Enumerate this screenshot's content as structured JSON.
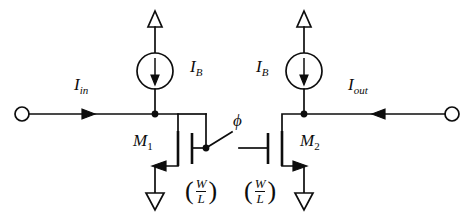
{
  "diagram": {
    "type": "circuit-schematic",
    "background_color": "#ffffff",
    "line_color": "#0d0d0d",
    "width": 476,
    "height": 219
  },
  "labels": {
    "i_in": {
      "symbol": "I",
      "subscript": "in"
    },
    "i_out": {
      "symbol": "I",
      "subscript": "out"
    },
    "i_bias_left": {
      "symbol": "I",
      "subscript": "B"
    },
    "i_bias_right": {
      "symbol": "I",
      "subscript": "B"
    },
    "m1": {
      "symbol": "M",
      "subscript": "1"
    },
    "m2": {
      "symbol": "M",
      "subscript": "2"
    },
    "phi": "ϕ",
    "ratio_left": {
      "numerator": "W",
      "denominator": "L",
      "open_paren": "(",
      "close_paren": ")"
    },
    "ratio_right": {
      "numerator": "W",
      "denominator": "L",
      "open_paren": "(",
      "close_paren": ")"
    }
  },
  "components": [
    {
      "name": "input-terminal",
      "kind": "open-terminal",
      "x": 22,
      "y": 114
    },
    {
      "name": "output-terminal",
      "kind": "open-terminal",
      "x": 452,
      "y": 114
    },
    {
      "name": "current-source-left",
      "kind": "current-source",
      "cx": 155,
      "cy": 71,
      "direction": "down"
    },
    {
      "name": "current-source-right",
      "kind": "current-source",
      "cx": 304,
      "cy": 71,
      "direction": "down"
    },
    {
      "name": "supply-arrow-left",
      "kind": "vdd-arrowhead",
      "x": 155,
      "y": 14
    },
    {
      "name": "supply-arrow-right",
      "kind": "vdd-arrowhead",
      "x": 304,
      "y": 14
    },
    {
      "name": "transistor-m1",
      "kind": "nmos",
      "x": 178,
      "y": 148,
      "orientation": "gate-right"
    },
    {
      "name": "transistor-m2",
      "kind": "nmos",
      "x": 282,
      "y": 148,
      "orientation": "gate-left"
    },
    {
      "name": "switch-phi",
      "kind": "spst-switch",
      "x1": 206,
      "y1": 148,
      "x2": 239,
      "y2": 148,
      "state": "open"
    },
    {
      "name": "ground-left",
      "kind": "ground-arrowhead",
      "x": 155,
      "y": 196
    },
    {
      "name": "ground-right",
      "kind": "ground-arrowhead",
      "x": 304,
      "y": 196
    },
    {
      "name": "node-dot-left",
      "kind": "junction",
      "x": 155,
      "y": 114
    },
    {
      "name": "node-dot-right",
      "kind": "junction",
      "x": 304,
      "y": 114
    },
    {
      "name": "node-dot-gate-m1",
      "kind": "junction",
      "x": 206,
      "y": 148
    },
    {
      "name": "current-arrow-in",
      "kind": "flow-arrow",
      "x": 90,
      "y": 114,
      "direction": "right"
    },
    {
      "name": "current-arrow-out",
      "kind": "flow-arrow",
      "x": 378,
      "y": 114,
      "direction": "left"
    }
  ]
}
